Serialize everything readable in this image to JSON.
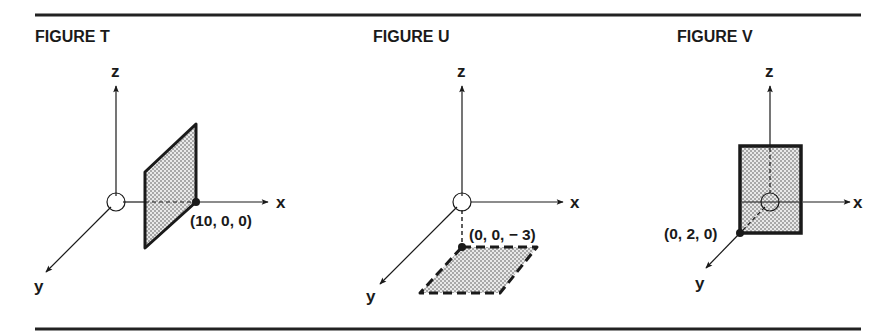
{
  "colors": {
    "ink": "#1a1a1a",
    "rule": "#222222",
    "fill_stipple_dot": "#555555",
    "fill_background": "#e6e6e6",
    "page": "#ffffff"
  },
  "figures": [
    {
      "id": "T",
      "title": "FIGURE T",
      "axes": {
        "x": "x",
        "y": "y",
        "z": "z"
      },
      "plane": {
        "orientation": "parallel to yz-plane",
        "border": "solid"
      },
      "point_label": "(10, 0, 0)",
      "point": [
        10,
        0,
        0
      ]
    },
    {
      "id": "U",
      "title": "FIGURE U",
      "axes": {
        "x": "x",
        "y": "y",
        "z": "z"
      },
      "plane": {
        "orientation": "parallel to xy-plane",
        "border": "dashed"
      },
      "point_label": "(0, 0, − 3)",
      "point": [
        0,
        0,
        -3
      ]
    },
    {
      "id": "V",
      "title": "FIGURE V",
      "axes": {
        "x": "x",
        "y": "y",
        "z": "z"
      },
      "plane": {
        "orientation": "parallel to xz-plane",
        "border": "solid"
      },
      "point_label": "(0, 2, 0)",
      "point": [
        0,
        2,
        0
      ]
    }
  ]
}
